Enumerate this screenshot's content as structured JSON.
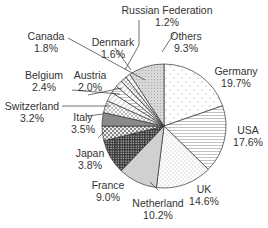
{
  "chart_data": {
    "type": "pie",
    "title": "",
    "start_angle_deg": 0,
    "direction": "clockwise",
    "categories": [
      "Germany",
      "USA",
      "UK",
      "Netherland",
      "France",
      "Japan",
      "Italy",
      "Switzerland",
      "Belgium",
      "Austria",
      "Canada",
      "Denmark",
      "Russian Federation",
      "Others"
    ],
    "values": [
      19.7,
      17.6,
      14.6,
      10.2,
      9.0,
      3.8,
      3.5,
      3.2,
      2.4,
      2.0,
      1.8,
      1.6,
      1.2,
      9.3
    ],
    "unit": "%",
    "legend": "none (labels with leader lines)"
  },
  "labels": {
    "germany": {
      "name": "Germany",
      "value": "19.7%"
    },
    "usa": {
      "name": "USA",
      "value": "17.6%"
    },
    "uk": {
      "name": "UK",
      "value": "14.6%"
    },
    "netherland": {
      "name": "Netherland",
      "value": "10.2%"
    },
    "france": {
      "name": "France",
      "value": "9.0%"
    },
    "japan": {
      "name": "Japan",
      "value": "3.8%"
    },
    "italy": {
      "name": "Italy",
      "value": "3.5%"
    },
    "switzerland": {
      "name": "Switzerland",
      "value": "3.2%"
    },
    "belgium": {
      "name": "Belgium",
      "value": "2.4%"
    },
    "austria": {
      "name": "Austria",
      "value": "2.0%"
    },
    "canada": {
      "name": "Canada",
      "value": "1.8%"
    },
    "denmark": {
      "name": "Denmark",
      "value": "1.6%"
    },
    "russia": {
      "name": "Russian   Federation",
      "value": "1.2%"
    },
    "others": {
      "name": "Others",
      "value": "9.3%"
    }
  }
}
